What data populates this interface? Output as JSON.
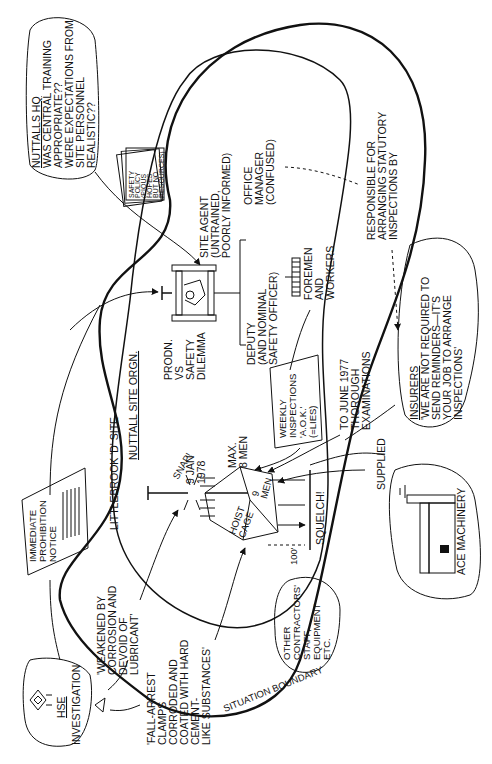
{
  "diagram": {
    "orientation": "rotated -90deg (text reads bottom to top)",
    "boundary_label": "SITUATION BOUNDARY",
    "site": {
      "title": "LITTLEBROOK 'D' SITE",
      "org_title": "NUTTALL SITE ORGN.",
      "dilemma": [
        "PRODN.",
        "VS",
        "SAFETY",
        "DILEMMA"
      ],
      "site_agent": [
        "SITE AGENT",
        "(UNTRAINED,",
        "POORLY INFORMED)"
      ],
      "office_manager": [
        "OFFICE",
        "MANAGER",
        "(CONFUSED)"
      ],
      "deputy": [
        "DEPUTY",
        "(AND NOMINAL",
        "SAFETY OFFICER)"
      ],
      "foremen": [
        "FOREMEN",
        "AND",
        "WORKERS"
      ],
      "weekly_inspections": [
        "WEEKLY",
        "INSPECTIONS",
        "'A.O.K.'",
        "(=LIES)"
      ],
      "thorough_exams": [
        "TO JUNE 1977",
        "THOROUGH",
        "EXAMINATIONS"
      ],
      "responsible": [
        "RESPONSIBLE FOR",
        "ARRANGING STATUTORY",
        "INSPECTIONS BY"
      ],
      "snap": "SNAP!",
      "date": [
        "9 JAN",
        "1978"
      ],
      "max": [
        "MAX.",
        "8 MEN"
      ],
      "cage_top": [
        "9",
        "MEN"
      ],
      "cage_side": [
        "HOIST",
        "CAGE"
      ],
      "squelch": "SQUELCH!",
      "height": "100'",
      "supplied": "SUPPLIED"
    },
    "safety_policy": [
      "SAFETY",
      "POLICY",
      "(PIOUS",
      "HOPES",
      "BUT NO",
      "RESOURCES)"
    ],
    "nuttalls_hq": {
      "title": "NUTTALLS HQ",
      "lines": [
        "WAS CENTRAL TRAINING",
        "APPROPRIATE??",
        "WERE EXPECTATIONS FROM",
        "SITE PERSONNEL",
        "REALISTIC??"
      ]
    },
    "insurers": {
      "title": "INSURERS",
      "lines": [
        "'WE ARE NOT REQUIRED TO",
        "SEND REMINDERS—IT'S",
        "YOUR JOB TO ARRANGE",
        "INSPECTIONS'"
      ]
    },
    "ace_machinery": "ACE MACHINERY",
    "other_contractors": [
      "OTHER",
      "CONTRACTORS'",
      "STAFF,",
      "EQUIPMENT",
      "ETC."
    ],
    "prohibition_notice": [
      "IMMEDIATE",
      "PROHIBITION",
      "NOTICE"
    ],
    "hse": {
      "title": "HSE",
      "subtitle": "INVESTIGATION"
    },
    "weakened_quote": [
      "'WEAKENED BY",
      "CORROSION AND",
      "DEVOID OF",
      "LUBRICANT'"
    ],
    "clamps_quote": [
      "'FALL-ARREST",
      "CLAMPS",
      "CORRODED AND",
      "COATED WITH HARD",
      "CEMENT-",
      "LIKE SUBSTANCES'"
    ]
  }
}
